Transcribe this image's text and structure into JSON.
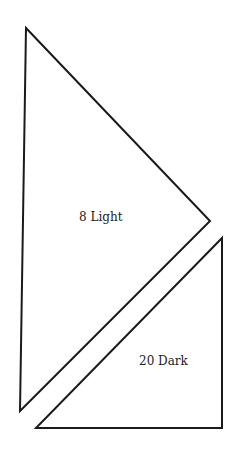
{
  "diagram": {
    "stroke_color": "#1a1a1a",
    "background": "#ffffff",
    "pieces": [
      {
        "name": "light-triangle",
        "label": "8 Light",
        "points": [
          [
            26,
            28
          ],
          [
            210,
            221
          ],
          [
            20,
            411
          ]
        ],
        "label_pos": [
          79,
          210
        ]
      },
      {
        "name": "dark-triangle",
        "label": "20 Dark",
        "points": [
          [
            222,
            238
          ],
          [
            222,
            428
          ],
          [
            36,
            428
          ]
        ],
        "label_pos": [
          139,
          354
        ]
      }
    ]
  }
}
